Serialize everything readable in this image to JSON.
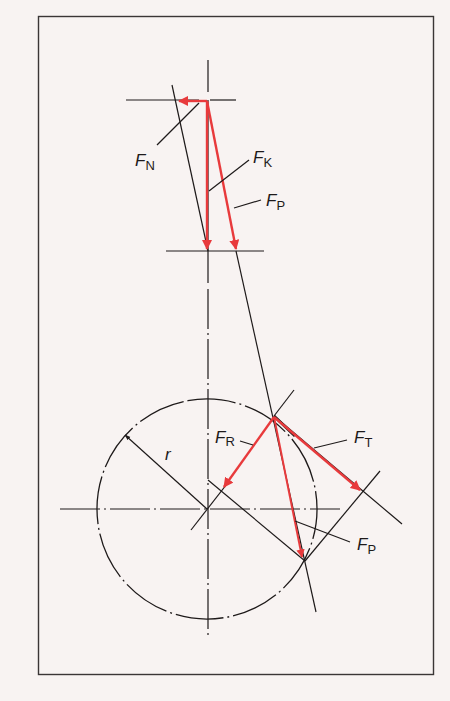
{
  "diagram": {
    "title": "",
    "colors": {
      "background": "#f8f3f2",
      "line": "#1e1a1a",
      "force": "#e83a3c"
    },
    "labels": {
      "fn": {
        "main": "F",
        "sub": "N"
      },
      "fk": {
        "main": "F",
        "sub": "K"
      },
      "fp_top": {
        "main": "F",
        "sub": "P"
      },
      "fr": {
        "main": "F",
        "sub": "R"
      },
      "ft": {
        "main": "F",
        "sub": "T"
      },
      "fp_bottom": {
        "main": "F",
        "sub": "P"
      },
      "r": "r"
    },
    "nodes": [
      {
        "id": "piston",
        "desc": "piston force node (top)"
      },
      {
        "id": "crank_pin",
        "desc": "crank pin on crank circle"
      },
      {
        "id": "crank_center",
        "desc": "crankshaft center"
      }
    ],
    "edges": [
      {
        "from": "piston",
        "to": "crank_pin",
        "label": "connecting rod line"
      },
      {
        "from": "crank_center",
        "to": "crank_pin",
        "label": "r"
      }
    ],
    "forces": [
      {
        "name": "FN",
        "desc": "normal force (horizontal, leftward)"
      },
      {
        "name": "FK",
        "desc": "piston force (vertical)"
      },
      {
        "name": "FP",
        "desc": "connecting rod force"
      },
      {
        "name": "FR",
        "desc": "radial force toward crank center"
      },
      {
        "name": "FT",
        "desc": "tangential force"
      },
      {
        "name": "FP",
        "desc": "rod force at crank pin"
      }
    ]
  }
}
